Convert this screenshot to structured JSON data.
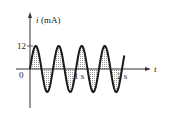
{
  "chart_data": {
    "type": "line",
    "title": "",
    "ylabel": "i (mA)",
    "ylabel_var": "i",
    "ylabel_unit": "(mA)",
    "xlabel": "t",
    "x_ticks": [
      {
        "value": 0,
        "label": "0"
      },
      {
        "value": 1,
        "label": "1 s"
      },
      {
        "value": 2,
        "label": "2 s"
      }
    ],
    "y_ticks": [
      {
        "value": 12,
        "label": "12"
      }
    ],
    "series": [
      {
        "name": "i(t)",
        "function": "12 sin(2*pi*2*t)",
        "amplitude_mA": 12,
        "frequency_Hz": 2,
        "period_s": 0.5,
        "t_range": [
          0,
          2.05
        ],
        "fill": "dotted shading between curve and axis"
      }
    ],
    "xlim": [
      0,
      2.3
    ],
    "ylim": [
      -12,
      12
    ],
    "grid": false,
    "legend": "none"
  },
  "labels": {
    "y_axis": "(mA)",
    "y_var": "i",
    "x_var": "t",
    "origin": "0",
    "peak": "12",
    "tick1": "1 s",
    "tick2": "2 s"
  },
  "colors": {
    "curve": "#1a1a1a",
    "axis": "#333333",
    "shading": "#9a9a9a"
  }
}
